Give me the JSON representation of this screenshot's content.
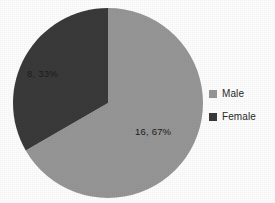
{
  "chart_data": {
    "type": "pie",
    "title": "",
    "categories": [
      "Male",
      "Female"
    ],
    "values": [
      16,
      8
    ],
    "percentages": [
      67,
      33
    ],
    "data_labels": [
      "16, 67%",
      "8, 33%"
    ],
    "colors": [
      "#969696",
      "#3a3a3a"
    ],
    "legend_position": "right",
    "grid": false,
    "start_angle_deg": 0,
    "direction": "clockwise",
    "background_color": "#fdfdfd",
    "label_text_color": "#1c1c1c"
  },
  "legend": {
    "items": [
      {
        "label": "Male",
        "color": "#969696"
      },
      {
        "label": "Female",
        "color": "#3a3a3a"
      }
    ]
  },
  "labels": {
    "male": "16, 67%",
    "female": "8, 33%"
  }
}
